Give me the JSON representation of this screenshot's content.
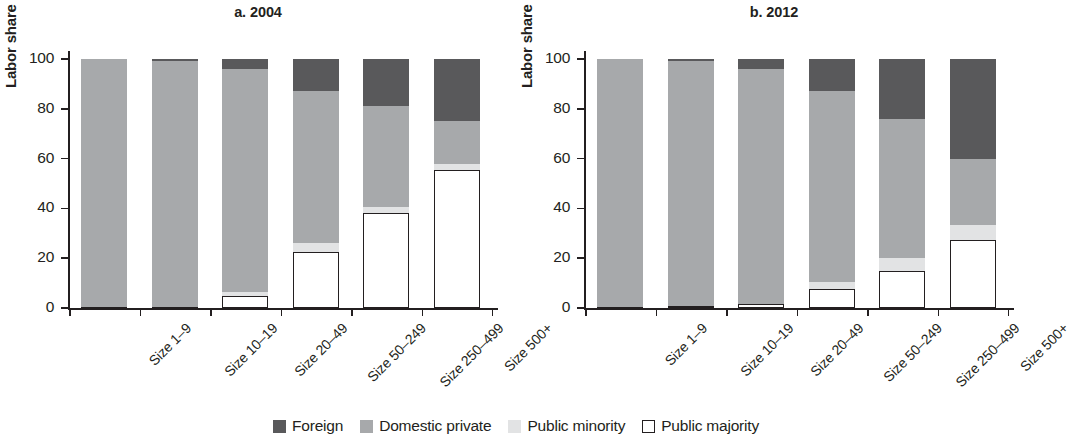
{
  "figure": {
    "ylabel": "Labor share",
    "panels": [
      {
        "title": "a. 2004"
      },
      {
        "title": "b. 2012"
      }
    ]
  },
  "legend": {
    "items": [
      {
        "label": "Foreign",
        "color": "#59595b",
        "icon": "square-filled-dark-icon"
      },
      {
        "label": "Domestic private",
        "color": "#a7a9ab",
        "icon": "square-filled-mid-icon"
      },
      {
        "label": "Public minority",
        "color": "#e2e3e4",
        "icon": "square-filled-light-icon"
      },
      {
        "label": "Public majority",
        "color": "#ffffff",
        "icon": "square-outline-icon"
      }
    ]
  },
  "chart_data": [
    {
      "type": "bar",
      "stacked": true,
      "stack_total": 100,
      "title": "a. 2004",
      "xlabel": "",
      "ylabel": "Labor share",
      "ylim": [
        0,
        100
      ],
      "yticks": [
        0,
        20,
        40,
        60,
        80,
        100
      ],
      "ytick_labels": [
        "0",
        "20",
        "40",
        "60",
        "80",
        "100"
      ],
      "grid": false,
      "legend_position": "bottom-center-shared",
      "categories": [
        "Size 1–9",
        "Size 10–19",
        "Size 20–49",
        "Size 50–249",
        "Size 250–499",
        "Size 500+"
      ],
      "series": [
        {
          "name": "Public majority",
          "color": "#ffffff",
          "values": [
            0.3,
            0.6,
            5.0,
            22.5,
            38.0,
            55.5
          ]
        },
        {
          "name": "Public minority",
          "color": "#e2e3e4",
          "values": [
            0.0,
            0.0,
            1.3,
            3.8,
            2.5,
            2.5
          ]
        },
        {
          "name": "Domestic private",
          "color": "#a7a9ab",
          "values": [
            99.7,
            98.4,
            89.7,
            60.7,
            40.5,
            17.0
          ]
        },
        {
          "name": "Foreign",
          "color": "#59595b",
          "values": [
            0.0,
            1.0,
            4.0,
            13.0,
            19.0,
            25.0
          ]
        }
      ]
    },
    {
      "type": "bar",
      "stacked": true,
      "stack_total": 100,
      "title": "b. 2012",
      "xlabel": "",
      "ylabel": "Labor share",
      "ylim": [
        0,
        100
      ],
      "yticks": [
        0,
        20,
        40,
        60,
        80,
        100
      ],
      "ytick_labels": [
        "0",
        "20",
        "40",
        "60",
        "80",
        "100"
      ],
      "grid": false,
      "legend_position": "bottom-center-shared",
      "categories": [
        "Size 1–9",
        "Size 10–19",
        "Size 20–49",
        "Size 50–249",
        "Size 250–499",
        "Size 500+"
      ],
      "series": [
        {
          "name": "Public majority",
          "color": "#ffffff",
          "values": [
            0.3,
            0.8,
            1.6,
            7.5,
            15.0,
            27.5
          ]
        },
        {
          "name": "Public minority",
          "color": "#e2e3e4",
          "values": [
            0.0,
            0.0,
            0.0,
            3.0,
            5.0,
            6.0
          ]
        },
        {
          "name": "Domestic private",
          "color": "#a7a9ab",
          "values": [
            99.7,
            98.2,
            94.4,
            76.5,
            56.0,
            26.5
          ]
        },
        {
          "name": "Foreign",
          "color": "#59595b",
          "values": [
            0.0,
            1.0,
            4.0,
            13.0,
            24.0,
            40.0
          ]
        }
      ]
    }
  ]
}
